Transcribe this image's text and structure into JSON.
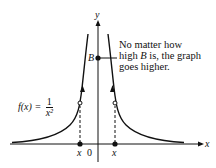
{
  "diagram": {
    "axes": {
      "x_label": "x",
      "y_label": "y",
      "origin_label": "0"
    },
    "function_label": {
      "lhs": "f(x) =",
      "numerator": "1",
      "denominator": "x²"
    },
    "y_marker": "B",
    "annotation": [
      "No matter how",
      "high B is, the graph",
      "goes higher."
    ],
    "annotation_parts": {
      "line1": "No matter how",
      "line2_pre": "high ",
      "line2_var": "B",
      "line2_post": " is, the graph",
      "line3": "goes higher."
    },
    "x_tick_labels": {
      "left": "x",
      "right": "x"
    }
  }
}
